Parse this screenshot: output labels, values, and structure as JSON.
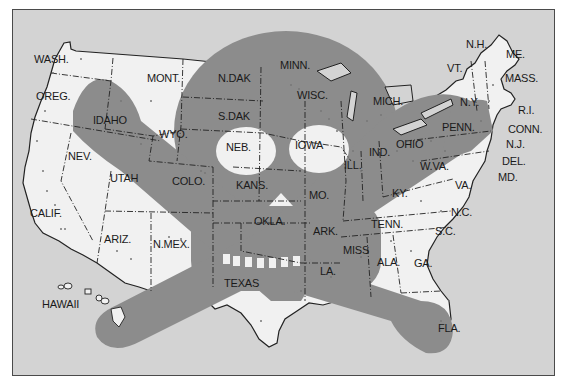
{
  "map": {
    "colors": {
      "ocean": "#d3d3d3",
      "land": "#f1f1f1",
      "skull_overlay": "#8c8c8c",
      "border": "#222222",
      "dots": "#777777"
    },
    "overlay": "skull-and-crossbones",
    "states": [
      {
        "label": "WASH.",
        "x": 34,
        "y": 60
      },
      {
        "label": "OREG.",
        "x": 36,
        "y": 97
      },
      {
        "label": "MONT.",
        "x": 147,
        "y": 79
      },
      {
        "label": "N.DAK",
        "x": 218,
        "y": 79
      },
      {
        "label": "MINN.",
        "x": 280,
        "y": 66
      },
      {
        "label": "IDAHO",
        "x": 93,
        "y": 121
      },
      {
        "label": "S.DAK",
        "x": 218,
        "y": 117
      },
      {
        "label": "WISC.",
        "x": 297,
        "y": 96
      },
      {
        "label": "MICH.",
        "x": 373,
        "y": 102
      },
      {
        "label": "WYO.",
        "x": 159,
        "y": 135
      },
      {
        "label": "NEB.",
        "x": 226,
        "y": 148
      },
      {
        "label": "IOWA",
        "x": 295,
        "y": 146
      },
      {
        "label": "NEV.",
        "x": 68,
        "y": 157
      },
      {
        "label": "UTAH",
        "x": 110,
        "y": 179
      },
      {
        "label": "COLO.",
        "x": 172,
        "y": 182
      },
      {
        "label": "KANS.",
        "x": 236,
        "y": 186
      },
      {
        "label": "ILL.",
        "x": 344,
        "y": 166
      },
      {
        "label": "IND.",
        "x": 369,
        "y": 153
      },
      {
        "label": "OHIO",
        "x": 396,
        "y": 145
      },
      {
        "label": "MO.",
        "x": 309,
        "y": 196
      },
      {
        "label": "KY.",
        "x": 392,
        "y": 194
      },
      {
        "label": "W.VA.",
        "x": 420,
        "y": 167
      },
      {
        "label": "VA.",
        "x": 455,
        "y": 186
      },
      {
        "label": "CALIF.",
        "x": 30,
        "y": 214
      },
      {
        "label": "OKLA.",
        "x": 254,
        "y": 222
      },
      {
        "label": "ARK.",
        "x": 313,
        "y": 232
      },
      {
        "label": "TENN.",
        "x": 371,
        "y": 225
      },
      {
        "label": "N.C.",
        "x": 451,
        "y": 213
      },
      {
        "label": "S.C.",
        "x": 435,
        "y": 232
      },
      {
        "label": "ARIZ.",
        "x": 104,
        "y": 240
      },
      {
        "label": "N.MEX.",
        "x": 153,
        "y": 245
      },
      {
        "label": "MISS",
        "x": 343,
        "y": 251
      },
      {
        "label": "ALA.",
        "x": 377,
        "y": 263
      },
      {
        "label": "GA.",
        "x": 414,
        "y": 264
      },
      {
        "label": "LA.",
        "x": 320,
        "y": 272
      },
      {
        "label": "TEXAS",
        "x": 224,
        "y": 284
      },
      {
        "label": "HAWAII",
        "x": 42,
        "y": 305
      },
      {
        "label": "FLA.",
        "x": 438,
        "y": 329
      },
      {
        "label": "N.H.",
        "x": 466,
        "y": 45
      },
      {
        "label": "ME.",
        "x": 506,
        "y": 55
      },
      {
        "label": "VT.",
        "x": 447,
        "y": 69
      },
      {
        "label": "MASS.",
        "x": 505,
        "y": 79
      },
      {
        "label": "N.Y.",
        "x": 460,
        "y": 103
      },
      {
        "label": "R.I.",
        "x": 518,
        "y": 111
      },
      {
        "label": "PENN.",
        "x": 442,
        "y": 128
      },
      {
        "label": "CONN.",
        "x": 508,
        "y": 130
      },
      {
        "label": "N.J.",
        "x": 506,
        "y": 145
      },
      {
        "label": "DEL.",
        "x": 502,
        "y": 162
      },
      {
        "label": "MD.",
        "x": 498,
        "y": 178
      }
    ]
  }
}
